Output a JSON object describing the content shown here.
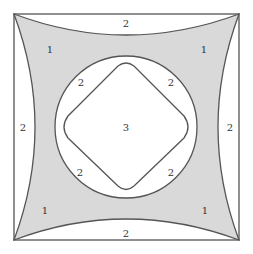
{
  "diagram": {
    "colors": {
      "stroke": "#555555",
      "shaded": "#d9d9d9",
      "background": "#ffffff"
    },
    "labels": {
      "top_strip": "2",
      "left_strip": "2",
      "right_strip": "2",
      "bottom_strip": "2",
      "shaded_top_left": "1",
      "shaded_top_right": "1",
      "shaded_bottom_left": "1",
      "shaded_bottom_right": "1",
      "ring_top_left": "2",
      "ring_top_right": "2",
      "ring_bottom_left": "2",
      "ring_bottom_right": "2",
      "center": "3"
    }
  }
}
